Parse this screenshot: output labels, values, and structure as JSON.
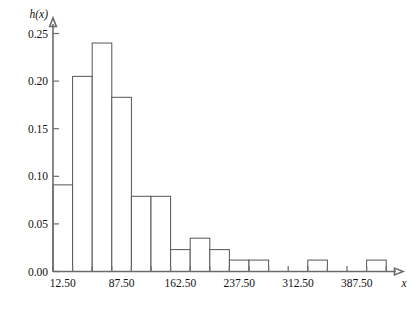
{
  "chart_data": {
    "type": "bar",
    "title": "",
    "subtitle": "",
    "xlabel": "x",
    "ylabel": "h(x)",
    "grid": false,
    "legend": false,
    "bin_width": 25,
    "bin_edges": [
      0,
      25,
      50,
      75,
      100,
      125,
      150,
      175,
      200,
      225,
      250,
      275,
      300,
      325,
      350,
      375,
      400,
      425
    ],
    "categories": [
      "0-25",
      "25-50",
      "50-75",
      "75-100",
      "100-125",
      "125-150",
      "150-175",
      "175-200",
      "200-225",
      "225-250",
      "250-275",
      "275-300",
      "300-325",
      "325-350",
      "350-375",
      "375-400",
      "400-425"
    ],
    "bin_midpoints": [
      12.5,
      37.5,
      62.5,
      87.5,
      112.5,
      137.5,
      162.5,
      187.5,
      212.5,
      237.5,
      262.5,
      287.5,
      312.5,
      337.5,
      362.5,
      387.5,
      412.5
    ],
    "values": [
      0.091,
      0.205,
      0.24,
      0.183,
      0.079,
      0.079,
      0.023,
      0.035,
      0.023,
      0.012,
      0.012,
      0.0,
      0.0,
      0.012,
      0.0,
      0.0,
      0.012
    ],
    "xlim": [
      0,
      437.5
    ],
    "ylim": [
      0.0,
      0.26
    ],
    "xticks": [
      12.5,
      87.5,
      162.5,
      237.5,
      312.5,
      387.5
    ],
    "xtick_labels": [
      "12.50",
      "87.50",
      "162.50",
      "237.50",
      "312.50",
      "387.50"
    ],
    "yticks": [
      0.0,
      0.05,
      0.1,
      0.15,
      0.2,
      0.25
    ],
    "ytick_labels": [
      "0.00",
      "0.05",
      "0.10",
      "0.15",
      "0.20",
      "0.25"
    ],
    "colors": {
      "bar_fill": "#ffffff",
      "bar_stroke": "#555555",
      "axis": "#6b6b6b",
      "text": "#111111",
      "background": "#ffffff"
    }
  }
}
